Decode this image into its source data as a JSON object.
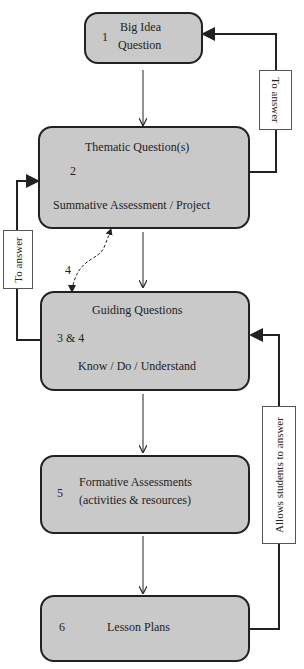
{
  "boxes": [
    {
      "number": "1",
      "line1": "Big Idea",
      "line2": "Question"
    },
    {
      "number": "2",
      "top": "Thematic Question(s)",
      "bottom": "Summative Assessment / Project"
    },
    {
      "number": "3 & 4",
      "top": "Guiding Questions",
      "bottom": "Know / Do / Understand"
    },
    {
      "number": "5",
      "line1": "Formative Assessments",
      "line2": "(activities & resources)"
    },
    {
      "number": "6",
      "label": "Lesson Plans"
    }
  ],
  "connectors": {
    "right_top_label": "To answer",
    "left_label": "To answer",
    "right_bottom_label": "Allows students to answer",
    "dashed_link_number": "4"
  },
  "colors": {
    "box_fill": "#c9c9c9",
    "stroke": "#222222"
  }
}
